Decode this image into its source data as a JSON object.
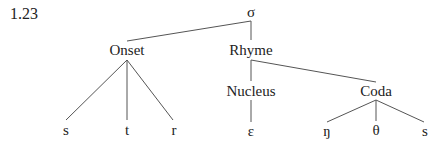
{
  "figure_label": "1.23",
  "tree": {
    "root": "σ",
    "onset": {
      "label": "Onset",
      "segments": [
        "s",
        "t",
        "r"
      ]
    },
    "rhyme": {
      "label": "Rhyme",
      "nucleus": {
        "label": "Nucleus",
        "segments": [
          "ɛ"
        ]
      },
      "coda": {
        "label": "Coda",
        "segments": [
          "ŋ",
          "θ",
          "s"
        ]
      }
    }
  },
  "colors": {
    "line": "#555555",
    "text": "#222222",
    "background": "#ffffff"
  }
}
